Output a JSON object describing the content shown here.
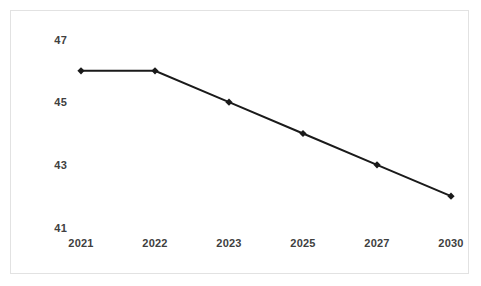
{
  "chart_data": {
    "type": "line",
    "title": "",
    "subtitle": "",
    "xlabel": "",
    "ylabel": "",
    "categories": [
      "2021",
      "2022",
      "2023",
      "2025",
      "2027",
      "2030"
    ],
    "x": [
      2021,
      2022,
      2023,
      2025,
      2027,
      2030
    ],
    "values": [
      46,
      46,
      45,
      44,
      43,
      42
    ],
    "series": [
      {
        "name": "",
        "values": [
          46,
          46,
          45,
          44,
          43,
          42
        ],
        "color": "#1a1a1a",
        "marker": "diamond",
        "line_width": 2
      }
    ],
    "ylim": [
      41,
      47
    ],
    "yticks": [
      41,
      43,
      45,
      47
    ],
    "ytick_labels": [
      "41",
      "43",
      "45",
      "47"
    ],
    "xtick_labels": [
      "2021",
      "2022",
      "2023",
      "2025",
      "2027",
      "2030"
    ],
    "grid": false,
    "legend": false,
    "legend_position": "none",
    "axis_line": false,
    "annotations": []
  },
  "colors": {
    "line": "#1a1a1a",
    "marker": "#1a1a1a",
    "tick_text": "#404040",
    "card_border": "#e2e2e2",
    "background": "#ffffff"
  },
  "layout": {
    "plot_left": 70,
    "plot_right": 440,
    "y_top_value_px": 28.5,
    "y_bottom_value_px": 216.5
  }
}
